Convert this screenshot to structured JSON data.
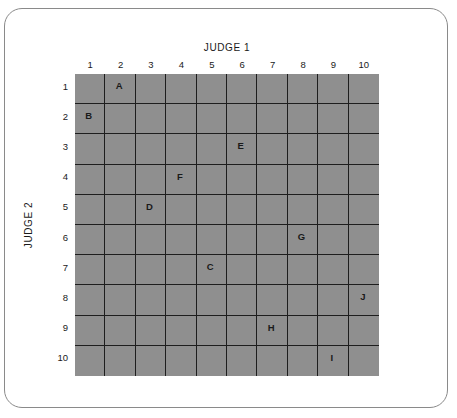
{
  "diagram": {
    "x_axis_title": "JUDGE 1",
    "y_axis_title": "JUDGE 2",
    "columns": [
      "1",
      "2",
      "3",
      "4",
      "5",
      "6",
      "7",
      "8",
      "9",
      "10"
    ],
    "rows": [
      "1",
      "2",
      "3",
      "4",
      "5",
      "6",
      "7",
      "8",
      "9",
      "10"
    ],
    "grid_color": "#8f8f8f",
    "line_color": "#1e1e1e",
    "items": [
      {
        "label": "A",
        "judge1": 2,
        "judge2": 1
      },
      {
        "label": "B",
        "judge1": 1,
        "judge2": 2
      },
      {
        "label": "C",
        "judge1": 5,
        "judge2": 7
      },
      {
        "label": "D",
        "judge1": 3,
        "judge2": 5
      },
      {
        "label": "E",
        "judge1": 6,
        "judge2": 3
      },
      {
        "label": "F",
        "judge1": 4,
        "judge2": 4
      },
      {
        "label": "G",
        "judge1": 8,
        "judge2": 6
      },
      {
        "label": "H",
        "judge1": 7,
        "judge2": 9
      },
      {
        "label": "I",
        "judge1": 9,
        "judge2": 10
      },
      {
        "label": "J",
        "judge1": 10,
        "judge2": 8
      }
    ]
  }
}
